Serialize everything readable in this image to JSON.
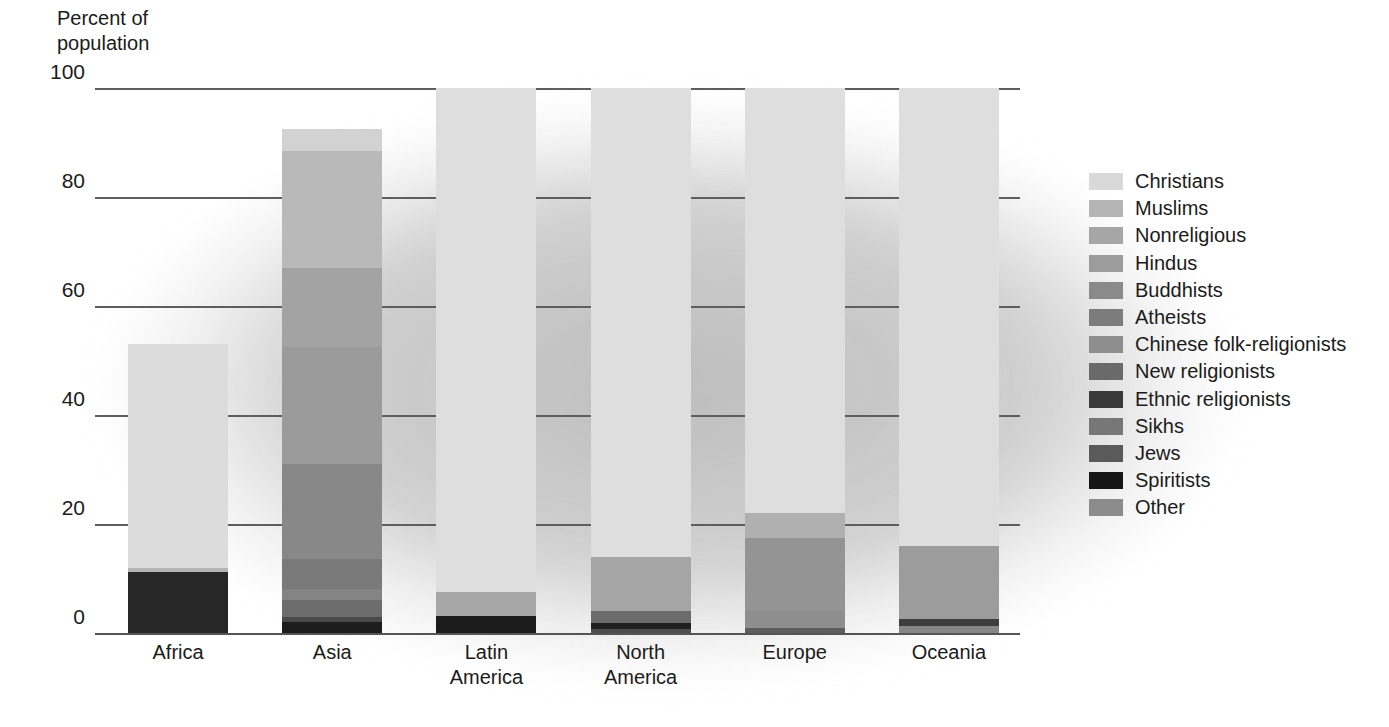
{
  "axis_title": "Percent of\npopulation",
  "chart_data": {
    "type": "bar",
    "subtype": "stacked-bar-100",
    "title": "Percent of population",
    "xlabel": "",
    "ylabel": "Percent of population",
    "ylim": [
      0,
      100
    ],
    "yticks": [
      0,
      20,
      40,
      60,
      80,
      100
    ],
    "grid": true,
    "legend_position": "right",
    "categories": [
      "Africa",
      "Asia",
      "Latin\nAmerica",
      "North\nAmerica",
      "Europe",
      "Oceania"
    ],
    "series": [
      {
        "name": "Christians",
        "color": "#d9d9d9",
        "values": [
          47.0,
          8.5,
          89.0,
          75.5,
          76.0,
          83.5
        ]
      },
      {
        "name": "Muslims",
        "color": "#b5b5b5",
        "values": [
          41.0,
          23.5,
          0.3,
          1.7,
          3.0,
          1.0
        ]
      },
      {
        "name": "Nonreligious",
        "color": "#a0a0a0",
        "values": [
          0.5,
          12.5,
          3.5,
          8.5,
          14.5,
          12.0
        ]
      },
      {
        "name": "Hindus",
        "color": "#9a9a9a",
        "values": [
          0.2,
          6.5,
          0.2,
          0.5,
          0.2,
          0.4
        ]
      },
      {
        "name": "Buddhists",
        "color": "#8a8a8a",
        "values": [
          0.0,
          6.0,
          0.1,
          0.8,
          0.3,
          0.3
        ]
      },
      {
        "name": "Atheists",
        "color": "#7b7b7b",
        "values": [
          0.1,
          3.5,
          0.5,
          1.6,
          4.5,
          0.5
        ]
      },
      {
        "name": "Chinese folk-religionists",
        "color": "#8f8f8f",
        "values": [
          0.0,
          10.0,
          0.1,
          0.2,
          0.0,
          0.1
        ]
      },
      {
        "name": "New religionists",
        "color": "#6b6b6b",
        "values": [
          0.0,
          2.8,
          0.1,
          0.3,
          0.2,
          0.1
        ]
      },
      {
        "name": "Ethnic religionists",
        "color": "#3a3a3a",
        "values": [
          11.0,
          3.0,
          1.0,
          0.1,
          0.0,
          0.2
        ]
      },
      {
        "name": "Sikhs",
        "color": "#6f6f6f",
        "values": [
          0.0,
          0.5,
          0.0,
          0.1,
          0.1,
          0.1
        ]
      },
      {
        "name": "Jews",
        "color": "#555555",
        "values": [
          0.1,
          0.3,
          0.3,
          1.9,
          0.4,
          0.3
        ]
      },
      {
        "name": "Spiritists",
        "color": "#151515",
        "values": [
          0.0,
          0.1,
          2.9,
          0.1,
          0.0,
          0.0
        ]
      },
      {
        "name": "Other",
        "color": "#8c8c8c",
        "values": [
          0.1,
          0.3,
          0.2,
          0.2,
          0.3,
          0.2
        ]
      }
    ],
    "bar_totals": [
      100,
      100,
      100,
      100,
      100,
      100
    ],
    "bar_visible_heights": [
      53,
      92.5,
      7.5,
      14,
      22,
      16
    ]
  },
  "legend": {
    "items": [
      {
        "label": "Christians",
        "color": "#d9d9d9"
      },
      {
        "label": "Muslims",
        "color": "#b5b5b5"
      },
      {
        "label": "Nonreligious",
        "color": "#a6a6a6"
      },
      {
        "label": "Hindus",
        "color": "#9c9c9c"
      },
      {
        "label": "Buddhists",
        "color": "#8a8a8a"
      },
      {
        "label": "Atheists",
        "color": "#7c7c7c"
      },
      {
        "label": "Chinese folk-religionists",
        "color": "#8e8e8e"
      },
      {
        "label": "New religionists",
        "color": "#6a6a6a"
      },
      {
        "label": "Ethnic religionists",
        "color": "#3a3a3a"
      },
      {
        "label": "Sikhs",
        "color": "#777777"
      },
      {
        "label": "Jews",
        "color": "#5a5a5a"
      },
      {
        "label": "Spiritists",
        "color": "#161616"
      },
      {
        "label": "Other",
        "color": "#8c8c8c"
      }
    ]
  },
  "bars": [
    {
      "name": "Africa",
      "label": "Africa",
      "top": 53.0,
      "segments": [
        {
          "series": "Christians",
          "from": 53.0,
          "to": 12.0,
          "color": "#dcdcdc"
        },
        {
          "series": "Muslims",
          "from": 12.0,
          "to": 0.0,
          "color": "#b4b4b4"
        }
      ],
      "stack": [
        {
          "series": "Christians",
          "span": [
            12.0,
            53.0
          ],
          "color": "#dcdcdc"
        },
        {
          "series": "Muslims",
          "span": [
            11.2,
            12.0
          ],
          "color": "#b4b4b4"
        },
        {
          "series": "Ethnic religionists",
          "span": [
            0.0,
            11.2
          ],
          "color": "#272727"
        }
      ]
    },
    {
      "name": "Asia",
      "label": "Asia",
      "top": 92.5,
      "stack": [
        {
          "series": "Christians",
          "span": [
            88.5,
            92.5
          ],
          "color": "#d2d2d2"
        },
        {
          "series": "Muslims",
          "span": [
            67.0,
            88.5
          ],
          "color": "#b9b9b9"
        },
        {
          "series": "Nonreligious",
          "span": [
            52.5,
            67.0
          ],
          "color": "#a3a3a3"
        },
        {
          "series": "Hindus",
          "span": [
            31.0,
            52.5
          ],
          "color": "#9b9b9b"
        },
        {
          "series": "Buddhists",
          "span": [
            13.5,
            31.0
          ],
          "color": "#888888"
        },
        {
          "series": "Chinese folk-religionists",
          "span": [
            8.0,
            13.5
          ],
          "color": "#7a7a7a"
        },
        {
          "series": "New religionists",
          "span": [
            6.0,
            8.0
          ],
          "color": "#848484"
        },
        {
          "series": "Ethnic religionists",
          "span": [
            3.0,
            6.0
          ],
          "color": "#6d6d6d"
        },
        {
          "series": "Sikhs",
          "span": [
            2.0,
            3.0
          ],
          "color": "#4a4a4a"
        },
        {
          "series": "Spiritists",
          "span": [
            0.0,
            2.0
          ],
          "color": "#1d1d1d"
        }
      ]
    },
    {
      "name": "Latin America",
      "label": "Latin\nAmerica",
      "top": 100.0,
      "stack": [
        {
          "series": "Christians",
          "span": [
            7.5,
            100.0
          ],
          "color": "#dedede"
        },
        {
          "series": "Nonreligious",
          "span": [
            3.2,
            7.5
          ],
          "color": "#a7a7a7"
        },
        {
          "series": "Spiritists",
          "span": [
            0.0,
            3.2
          ],
          "color": "#1b1b1b"
        }
      ]
    },
    {
      "name": "North America",
      "label": "North\nAmerica",
      "top": 100.0,
      "stack": [
        {
          "series": "Christians",
          "span": [
            14.0,
            100.0
          ],
          "color": "#dedede"
        },
        {
          "series": "Nonreligious",
          "span": [
            4.0,
            14.0
          ],
          "color": "#a5a5a5"
        },
        {
          "series": "Jews",
          "span": [
            1.8,
            4.0
          ],
          "color": "#6c6c6c"
        },
        {
          "series": "Spiritists",
          "span": [
            0.8,
            1.8
          ],
          "color": "#1f1f1f"
        },
        {
          "series": "Other",
          "span": [
            0.0,
            0.8
          ],
          "color": "#4e4e4e"
        }
      ]
    },
    {
      "name": "Europe",
      "label": "Europe",
      "top": 100.0,
      "stack": [
        {
          "series": "Christians",
          "span": [
            22.0,
            100.0
          ],
          "color": "#dedede"
        },
        {
          "series": "Muslims",
          "span": [
            17.5,
            22.0
          ],
          "color": "#b0b0b0"
        },
        {
          "series": "Nonreligious",
          "span": [
            4.0,
            17.5
          ],
          "color": "#949494"
        },
        {
          "series": "Atheists",
          "span": [
            1.0,
            4.0
          ],
          "color": "#8e8e8e"
        },
        {
          "series": "Jews",
          "span": [
            0.0,
            1.0
          ],
          "color": "#5e5e5e"
        }
      ]
    },
    {
      "name": "Oceania",
      "label": "Oceania",
      "top": 100.0,
      "stack": [
        {
          "series": "Christians",
          "span": [
            16.0,
            100.0
          ],
          "color": "#dedede"
        },
        {
          "series": "Nonreligious",
          "span": [
            2.6,
            16.0
          ],
          "color": "#9c9c9c"
        },
        {
          "series": "Ethnic religionists",
          "span": [
            1.2,
            2.6
          ],
          "color": "#3d3d3d"
        },
        {
          "series": "Other",
          "span": [
            0.0,
            1.2
          ],
          "color": "#868686"
        }
      ]
    }
  ],
  "yaxis": {
    "ticks": [
      "100",
      "80",
      "60",
      "40",
      "20",
      "0"
    ],
    "values": [
      100,
      80,
      60,
      40,
      20,
      0
    ]
  }
}
